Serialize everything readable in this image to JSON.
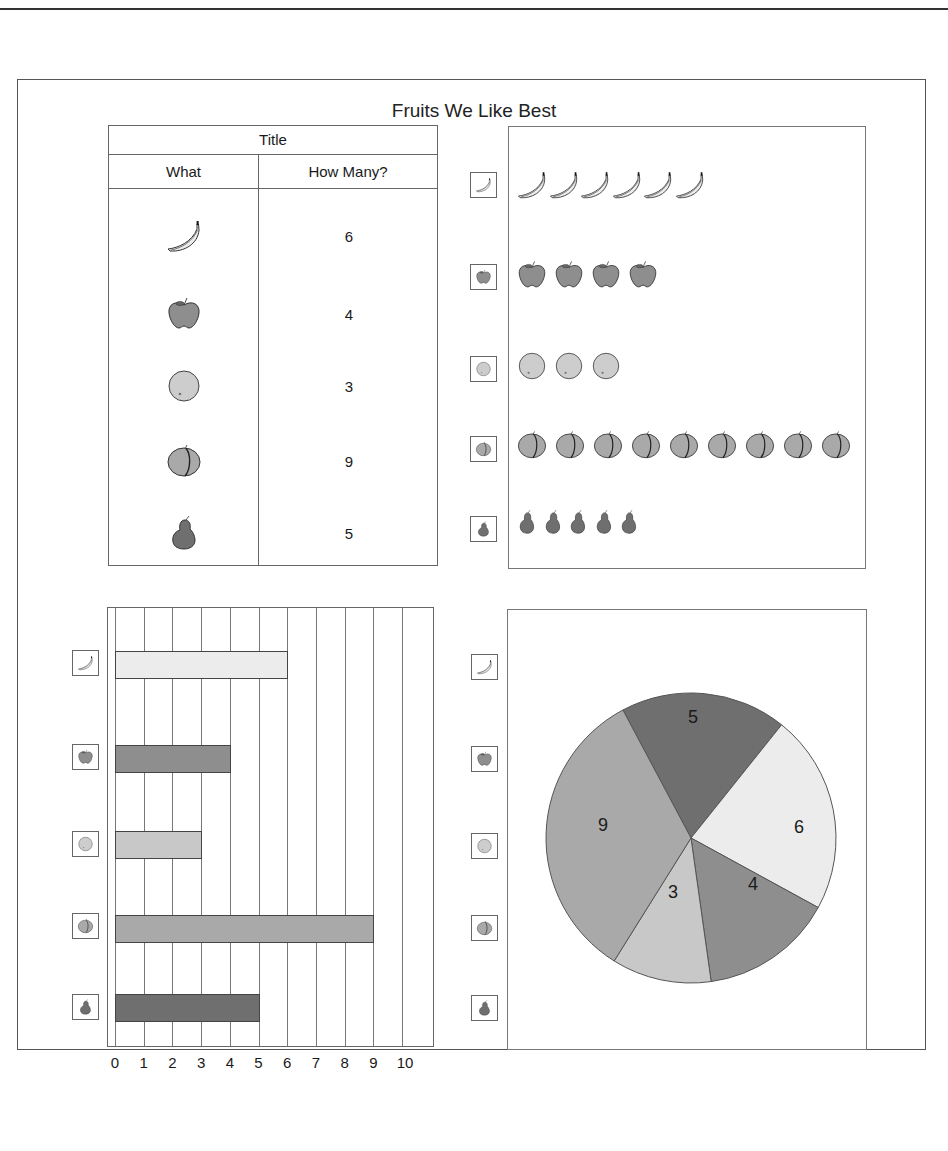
{
  "page": {
    "title": "Fruits We Like Best"
  },
  "table": {
    "title": "Title",
    "headers": [
      "What",
      "How Many?"
    ],
    "rows": [
      {
        "fruit": "banana",
        "icon": "banana-icon",
        "count": "6"
      },
      {
        "fruit": "apple",
        "icon": "apple-icon",
        "count": "4"
      },
      {
        "fruit": "orange",
        "icon": "orange-icon",
        "count": "3"
      },
      {
        "fruit": "peach",
        "icon": "peach-icon",
        "count": "9"
      },
      {
        "fruit": "pear",
        "icon": "pear-icon",
        "count": "5"
      }
    ]
  },
  "colors": {
    "banana": "#ececec",
    "apple": "#8e8e8e",
    "orange": "#c8c8c8",
    "peach": "#a9a9a9",
    "pear": "#6f6f6f",
    "border": "#555555"
  },
  "chart_data": [
    {
      "type": "table",
      "title": "Title",
      "columns": [
        "What",
        "How Many?"
      ],
      "rows": [
        [
          "banana",
          6
        ],
        [
          "apple",
          4
        ],
        [
          "orange",
          3
        ],
        [
          "peach",
          9
        ],
        [
          "pear",
          5
        ]
      ]
    },
    {
      "type": "pictograph",
      "title": "Fruits We Like Best",
      "categories": [
        "banana",
        "apple",
        "orange",
        "peach",
        "pear"
      ],
      "values": [
        6,
        4,
        3,
        9,
        5
      ]
    },
    {
      "type": "bar",
      "orientation": "horizontal",
      "categories": [
        "banana",
        "apple",
        "orange",
        "peach",
        "pear"
      ],
      "values": [
        6,
        4,
        3,
        9,
        5
      ],
      "xlabel": "",
      "ylabel": "",
      "xticks": [
        "0",
        "1",
        "2",
        "3",
        "4",
        "5",
        "6",
        "7",
        "8",
        "9",
        "10"
      ],
      "xlim": [
        0,
        10
      ],
      "grid": true
    },
    {
      "type": "pie",
      "categories": [
        "pear",
        "banana",
        "apple",
        "orange",
        "peach"
      ],
      "values": [
        5,
        6,
        4,
        3,
        9
      ],
      "labels": [
        "5",
        "6",
        "4",
        "3",
        "9"
      ]
    }
  ],
  "bar_chart": {
    "ticks": [
      "0",
      "1",
      "2",
      "3",
      "4",
      "5",
      "6",
      "7",
      "8",
      "9",
      "10"
    ]
  },
  "pie_chart": {
    "labels": {
      "pear": "5",
      "banana": "6",
      "apple": "4",
      "orange": "3",
      "peach": "9"
    }
  }
}
